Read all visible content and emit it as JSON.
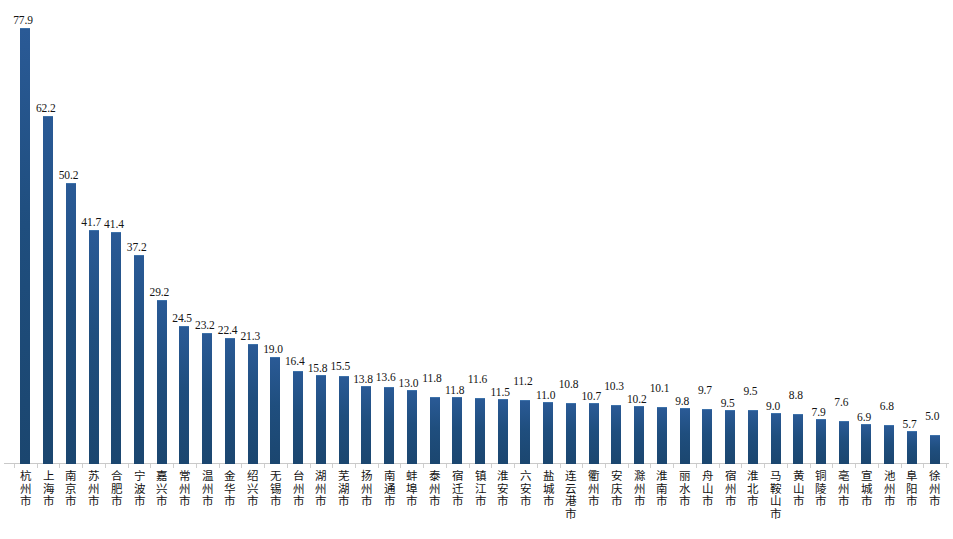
{
  "chart_data": {
    "type": "bar",
    "title": "",
    "subtitle": "",
    "xlabel": "",
    "ylabel": "",
    "ylim": [
      0,
      85
    ],
    "grid": false,
    "legend": false,
    "orientation": "vertical",
    "bar_color": "#1F4E7E",
    "label_rotation": "vertical-cjk",
    "categories": [
      "杭州市",
      "上海市",
      "南京市",
      "苏州市",
      "合肥市",
      "宁波市",
      "嘉兴市",
      "常州市",
      "温州市",
      "金华市",
      "绍兴市",
      "无锡市",
      "台州市",
      "湖州市",
      "芜湖市",
      "扬州市",
      "南通市",
      "蚌埠市",
      "泰州市",
      "宿迁市",
      "镇江市",
      "淮安市",
      "六安市",
      "盐城市",
      "连云港市",
      "衢州市",
      "安庆市",
      "滁州市",
      "淮南市",
      "丽水市",
      "舟山市",
      "宿州市",
      "淮北市",
      "马鞍山市",
      "黄山市",
      "铜陵市",
      "亳州市",
      "宣城市",
      "池州市",
      "阜阳市",
      "徐州市"
    ],
    "values": [
      77.9,
      62.2,
      50.2,
      41.7,
      41.4,
      37.2,
      29.2,
      24.5,
      23.2,
      22.4,
      21.3,
      19.0,
      16.4,
      15.8,
      15.5,
      13.8,
      13.6,
      13.0,
      11.8,
      11.8,
      11.6,
      11.5,
      11.2,
      11.0,
      10.8,
      10.7,
      10.3,
      10.2,
      10.1,
      9.8,
      9.7,
      9.5,
      9.5,
      9.0,
      8.8,
      7.9,
      7.6,
      6.9,
      6.8,
      5.7,
      5.0
    ],
    "value_labels": [
      "77.9",
      "62.2",
      "50.2",
      "41.7",
      "41.4",
      "37.2",
      "29.2",
      "24.5",
      "23.2",
      "22.4",
      "21.3",
      "19.0",
      "16.4",
      "15.8",
      "15.5",
      "13.8",
      "13.6",
      "13.0",
      "11.8",
      "11.8",
      "11.6",
      "11.5",
      "11.2",
      "11.0",
      "10.8",
      "10.7",
      "10.3",
      "10.2",
      "10.1",
      "9.8",
      "9.7",
      "9.5",
      "9.5",
      "9.0",
      "8.8",
      "7.9",
      "7.6",
      "6.9",
      "6.8",
      "5.7",
      "5.0"
    ]
  }
}
